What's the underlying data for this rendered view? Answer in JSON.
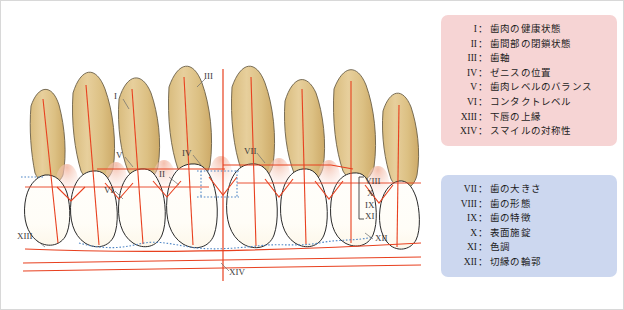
{
  "figure": {
    "colors": {
      "tooth_crown": "#fffdf8",
      "tooth_root": "#dec389",
      "root_outline": "#6b6048",
      "crown_outline": "#2a2a2a",
      "reference_line": "#e8401f",
      "dotted_guide": "#4f86c6",
      "legend_pink": "#f6d4d4",
      "legend_blue": "#ccd7ef",
      "frame_border": "#d8d8d8",
      "label_text": "#3b3b3b"
    }
  },
  "legend_pink": {
    "items": [
      {
        "numeral": "I",
        "label": "歯肉の健康状態"
      },
      {
        "numeral": "II",
        "label": "歯間部の閉鎖状態"
      },
      {
        "numeral": "III",
        "label": "歯軸"
      },
      {
        "numeral": "IV",
        "label": "ゼニスの位置"
      },
      {
        "numeral": "V",
        "label": "歯肉レベルのバランス"
      },
      {
        "numeral": "VI",
        "label": "コンタクトレベル"
      },
      {
        "numeral": "XIII",
        "label": "下唇の上縁"
      },
      {
        "numeral": "XIV",
        "label": "スマイルの対称性"
      }
    ]
  },
  "legend_blue": {
    "items": [
      {
        "numeral": "VII",
        "label": "歯の大きさ"
      },
      {
        "numeral": "VIII",
        "label": "歯の形態"
      },
      {
        "numeral": "IX",
        "label": "歯の特徴"
      },
      {
        "numeral": "X",
        "label": "表面施錠"
      },
      {
        "numeral": "XI",
        "label": "色調"
      },
      {
        "numeral": "XII",
        "label": "切縁の輪郭"
      }
    ]
  },
  "diagram_labels": {
    "i": "I",
    "ii": "II",
    "iii": "III",
    "iv": "IV",
    "v": "V",
    "vi": "VI",
    "vii": "VII",
    "xii": "XII",
    "xiii": "XIII",
    "xiv": "XIV",
    "bracket": [
      "VIII",
      "X",
      "IX",
      "XI"
    ]
  }
}
